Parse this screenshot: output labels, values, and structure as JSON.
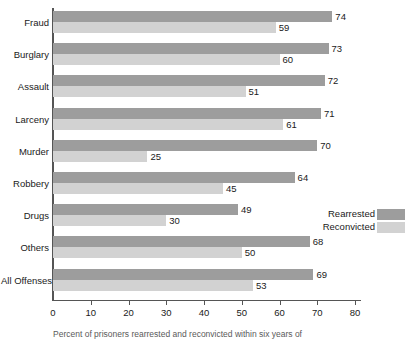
{
  "chart_data": {
    "type": "bar",
    "orientation": "horizontal",
    "title": "",
    "xlabel": "",
    "ylabel": "",
    "xlim": [
      0,
      80
    ],
    "xticks": [
      0,
      10,
      20,
      30,
      40,
      50,
      60,
      70,
      80
    ],
    "grid": false,
    "legend_position": "middle-right",
    "categories": [
      "Fraud",
      "Burglary",
      "Assault",
      "Larceny",
      "Murder",
      "Robbery",
      "Drugs",
      "Others",
      "All Offenses"
    ],
    "series": [
      {
        "name": "Rearrested",
        "color": "#9d9d9d",
        "values": [
          74,
          73,
          72,
          71,
          70,
          64,
          49,
          68,
          69
        ]
      },
      {
        "name": "Reconvicted",
        "color": "#d2d2d2",
        "values": [
          59,
          60,
          51,
          61,
          25,
          45,
          30,
          50,
          53
        ]
      }
    ],
    "caption": "Percent of prisoners rearrested and reconvicted within six years of"
  },
  "legend": {
    "items": [
      {
        "label": "Rearrested"
      },
      {
        "label": "Reconvicted"
      }
    ]
  },
  "colors": {
    "rearrested": "#9d9d9d",
    "reconvicted": "#d2d2d2",
    "axis": "#555555",
    "text": "#1a1a1a"
  }
}
